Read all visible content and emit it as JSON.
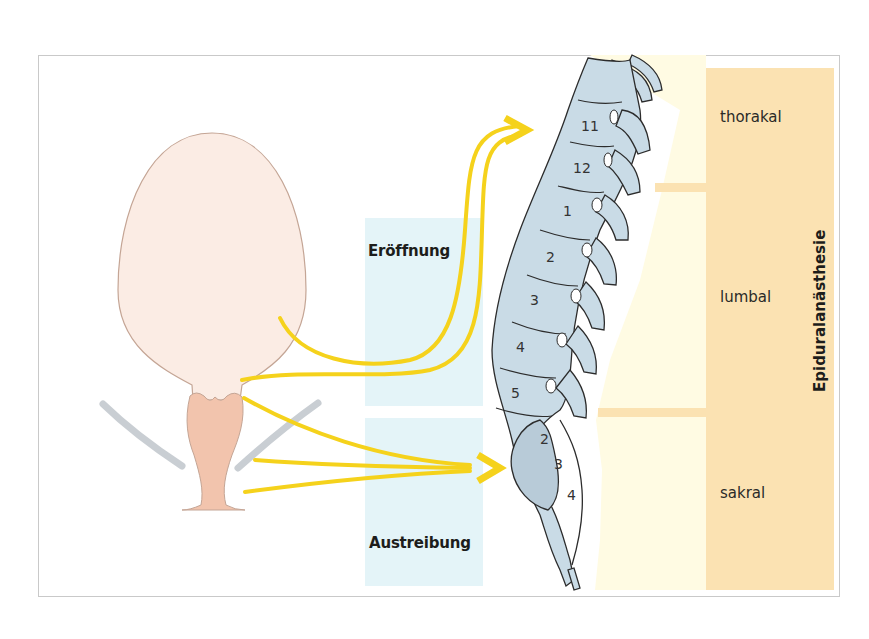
{
  "figure": {
    "type": "anatomical-diagram"
  },
  "phases": [
    {
      "id": "eroeffnung",
      "label": "Eröffnung",
      "target": "thorakal T11–T12"
    },
    {
      "id": "austreibung",
      "label": "Austreibung",
      "target": "sakral S2–S4"
    }
  ],
  "regions": [
    {
      "id": "thorakal",
      "label": "thorakal"
    },
    {
      "id": "lumbal",
      "label": "lumbal"
    },
    {
      "id": "sakral",
      "label": "sakral"
    }
  ],
  "vertical_title": "Epiduralanästhesie",
  "vertebrae": {
    "thoracic": [
      "11",
      "12"
    ],
    "lumbar": [
      "1",
      "2",
      "3",
      "4",
      "5"
    ],
    "sacral": [
      "2",
      "3",
      "4"
    ]
  },
  "colors": {
    "uterus_fill": "#fbece4",
    "uterus_stroke": "#c4a595",
    "cervix_fill": "#f2c4ad",
    "pelvic_floor": "#c9ced3",
    "nerve_arrow": "#f5d21c",
    "phase_box": "#e4f4f8",
    "spine_fill": "#c9dbe6",
    "spine_stroke": "#2c2c2c",
    "band_light": "#fffbe1",
    "band_dark": "#fbe2b2"
  }
}
